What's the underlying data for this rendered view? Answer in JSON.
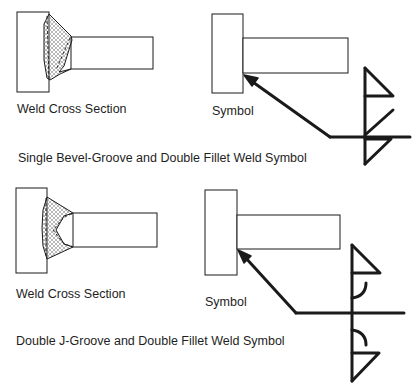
{
  "diagrams": [
    {
      "id": "single-bevel",
      "cross_section_label": "Weld Cross Section",
      "symbol_label": "Symbol",
      "title": "Single Bevel-Groove and Double Fillet Weld Symbol",
      "weld_symbols": [
        "fillet-arrow-side",
        "bevel-groove-other-side",
        "fillet-other-side"
      ]
    },
    {
      "id": "double-j",
      "cross_section_label": "Weld Cross Section",
      "symbol_label": "Symbol",
      "title": "Double J-Groove and Double Fillet Weld Symbol",
      "weld_symbols": [
        "fillet-other-side",
        "j-groove-other-side",
        "j-groove-arrow-side",
        "fillet-arrow-side"
      ]
    }
  ],
  "colors": {
    "line": "#1a1a1a",
    "hatch": "#8a8a8a",
    "background": "#ffffff"
  }
}
